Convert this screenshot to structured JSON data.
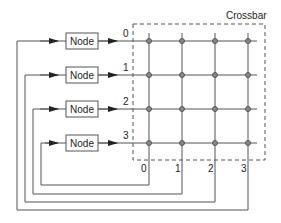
{
  "diagram": {
    "crossbar_label": "Crossbar",
    "node_label": "Node",
    "nodes": [
      {
        "label": "Node",
        "port": "0"
      },
      {
        "label": "Node",
        "port": "1"
      },
      {
        "label": "Node",
        "port": "2"
      },
      {
        "label": "Node",
        "port": "3"
      }
    ],
    "row_labels": [
      "0",
      "1",
      "2",
      "3"
    ],
    "column_labels": [
      "0",
      "1",
      "2",
      "3"
    ],
    "colors": {
      "line": "#555555",
      "box_border": "#555555",
      "dashed": "#555555",
      "junction": "#666666"
    }
  }
}
